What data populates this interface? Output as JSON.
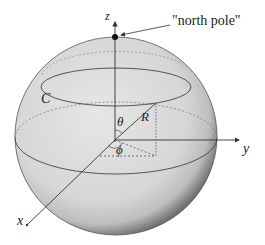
{
  "figure": {
    "labels": {
      "z_axis": "z",
      "y_axis": "y",
      "x_axis": "x",
      "north_pole": "\"north pole\"",
      "circle": "C",
      "theta": "θ",
      "phi": "ϕ",
      "radius": "R"
    },
    "colors": {
      "sphere_fill": "#d9d9d9",
      "sphere_shadow": "#7a7a7a",
      "lines": "#333333",
      "background": "#ffffff"
    }
  }
}
